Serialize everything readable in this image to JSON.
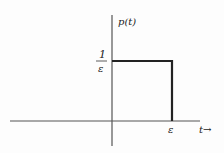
{
  "diagram": {
    "type": "rectangular-pulse",
    "y_axis_label": "p(t)",
    "x_axis_label": "t→",
    "height_label_numerator": "1",
    "height_label_denominator": "ε",
    "width_label": "ε",
    "colors": {
      "axis": "#555555",
      "pulse": "#222222",
      "background": "#fdfdfd"
    }
  }
}
